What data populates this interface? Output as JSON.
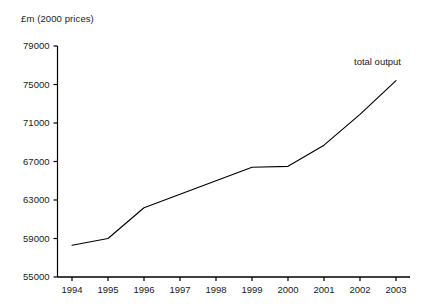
{
  "chart_data": {
    "type": "line",
    "title": "",
    "ylabel": "£m (2000 prices)",
    "xlabel": "",
    "ylim": [
      55000,
      79000
    ],
    "yticks": [
      55000,
      59000,
      63000,
      67000,
      71000,
      75000,
      79000
    ],
    "ytick_labels": [
      "55000",
      "59000",
      "63000",
      "67000",
      "71000",
      "75000",
      "79000"
    ],
    "categories": [
      "1994",
      "1995",
      "1996",
      "1997",
      "1998",
      "1999",
      "2000",
      "2001",
      "2002",
      "2003"
    ],
    "x": [
      1994,
      1995,
      1996,
      1997,
      1998,
      1999,
      2000,
      2001,
      2002,
      2003
    ],
    "grid": false,
    "legend_position": "inline-right",
    "annotations": [
      {
        "text": "total output",
        "x": 2003,
        "y": 77500
      }
    ],
    "series": [
      {
        "name": "total output",
        "color": "#000000",
        "values": [
          58300,
          59000,
          62200,
          63600,
          65000,
          66400,
          66500,
          68700,
          71900,
          75400
        ]
      }
    ]
  },
  "axis": {
    "y_title": "£m (2000 prices)",
    "series_label": "total output"
  }
}
